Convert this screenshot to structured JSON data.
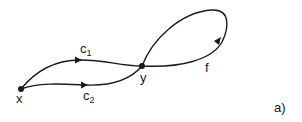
{
  "diagram": {
    "nodes": [
      {
        "id": "x",
        "label": "x"
      },
      {
        "id": "y",
        "label": "y"
      }
    ],
    "edges": [
      {
        "id": "c1",
        "from": "x",
        "to": "y",
        "label_base": "c",
        "label_sub": "1"
      },
      {
        "id": "c2",
        "from": "x",
        "to": "y",
        "label_base": "c",
        "label_sub": "2"
      },
      {
        "id": "f",
        "from": "y",
        "to": "y",
        "label": "f",
        "type": "loop"
      }
    ],
    "panel_label": "a)",
    "colors": {
      "ink": "#1a1a1a",
      "background": "#ffffff"
    }
  }
}
